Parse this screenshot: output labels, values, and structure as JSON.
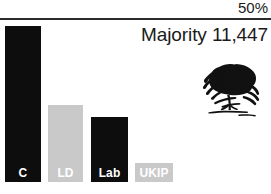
{
  "chart_data": {
    "type": "bar",
    "title": "",
    "subtitle": "Majority 11,447",
    "categories": [
      "C",
      "LD",
      "Lab",
      "UKIP"
    ],
    "values": [
      47.5,
      23.3,
      19.6,
      0
    ],
    "xlabel": "",
    "ylabel": "",
    "ylim": [
      0,
      50
    ],
    "axis_max_label": "50%",
    "grid": false,
    "legend": "none",
    "series": [
      {
        "name": "Vote share",
        "values": [
          47.5,
          23.3,
          19.6,
          0
        ]
      }
    ],
    "bars": [
      {
        "label": "C",
        "value": 47.5,
        "color": "#0d0d0d",
        "text_color": "#ffffff",
        "has_bar": true
      },
      {
        "label": "LD",
        "value": 23.3,
        "color": "#c9c9c9",
        "text_color": "#ffffff",
        "has_bar": true
      },
      {
        "label": "Lab",
        "value": 19.6,
        "color": "#0d0d0d",
        "text_color": "#ffffff",
        "has_bar": true
      },
      {
        "label": "UKIP",
        "value": 0,
        "color": "#c9c9c9",
        "text_color": "#ffffff",
        "has_bar": false
      }
    ]
  },
  "header": {
    "axis_top_label": "50%",
    "majority_text": "Majority 11,447"
  },
  "logo": {
    "name": "conservative-oak-tree-logo"
  },
  "colors": {
    "bar_dark": "#0d0d0d",
    "bar_light": "#c9c9c9",
    "rule": "#2b2b2b",
    "text": "#1a1a1a",
    "background": "#ffffff"
  }
}
